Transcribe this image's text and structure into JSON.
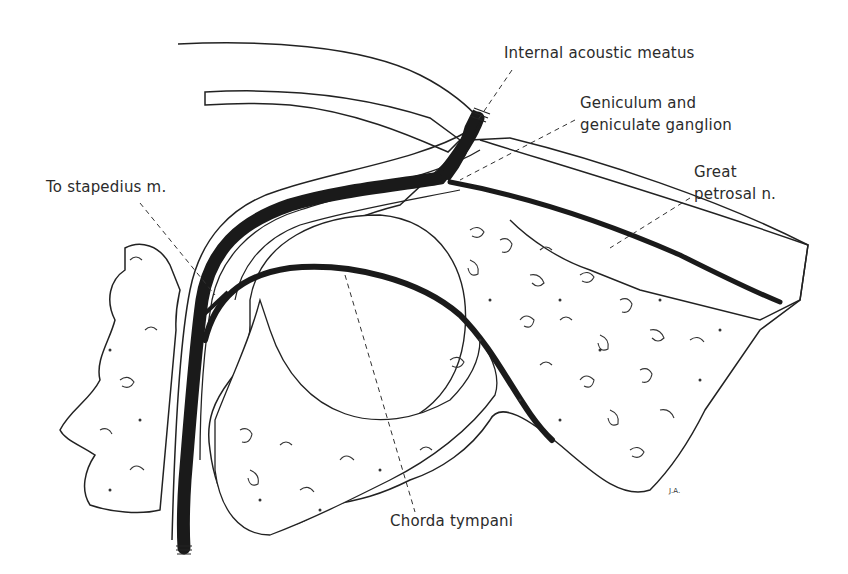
{
  "figure": {
    "colors": {
      "nerve": "#1a1a1a",
      "outline": "#222222",
      "background": "#ffffff",
      "label": "#2b2b2b"
    }
  },
  "labels": {
    "internal_acoustic_meatus": "Internal acoustic meatus",
    "geniculum_line1": "Geniculum and",
    "geniculum_line2": "geniculate ganglion",
    "great_petrosal_line1": "Great",
    "great_petrosal_line2": "petrosal n.",
    "to_stapedius": "To stapedius m.",
    "chorda_tympani": "Chorda tympani"
  },
  "signature": "J.A."
}
